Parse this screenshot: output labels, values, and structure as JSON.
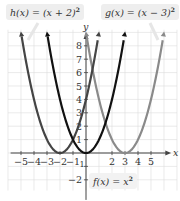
{
  "chart_data": {
    "type": "line",
    "title": "",
    "xlabel": "x",
    "ylabel": "y",
    "xlim": [
      -5.5,
      6
    ],
    "ylim": [
      -2.5,
      9
    ],
    "grid": true,
    "x_ticks": [
      -5,
      -4,
      -3,
      -2,
      -1,
      2,
      3,
      4,
      5
    ],
    "y_ticks": [
      -2,
      -1,
      1,
      2,
      3,
      4,
      5,
      6,
      7,
      8
    ],
    "series": [
      {
        "name": "f(x) = x²",
        "label_text": "f(x) = x",
        "exponent": "2",
        "vertex": [
          0,
          0
        ],
        "shift": 0,
        "color": "#111111",
        "x": [
          -3,
          -2,
          -1,
          0,
          1,
          2,
          3
        ],
        "y": [
          9,
          4,
          1,
          0,
          1,
          4,
          9
        ]
      },
      {
        "name": "h(x) = (x + 2)²",
        "label_text": "h(x) = (x + 2)",
        "exponent": "2",
        "vertex": [
          -2,
          0
        ],
        "shift": -2,
        "color": "#444444",
        "x": [
          -5,
          -4,
          -3,
          -2,
          -1,
          0,
          1
        ],
        "y": [
          9,
          4,
          1,
          0,
          1,
          4,
          9
        ]
      },
      {
        "name": "g(x) = (x − 3)²",
        "label_text": "g(x) = (x − 3)",
        "exponent": "2",
        "vertex": [
          3,
          0
        ],
        "shift": 3,
        "color": "#8a8a8a",
        "x": [
          0,
          1,
          2,
          3,
          4,
          5,
          6
        ],
        "y": [
          9,
          4,
          1,
          0,
          1,
          4,
          9
        ]
      }
    ]
  },
  "labels": {
    "h": {
      "text": "h(x) = (x + 2)",
      "exp": "2"
    },
    "g": {
      "text": "g(x) = (x − 3)",
      "exp": "2"
    },
    "f": {
      "text": "f(x) = x",
      "exp": "2"
    }
  },
  "axes": {
    "x_label": "x",
    "y_label": "y"
  }
}
